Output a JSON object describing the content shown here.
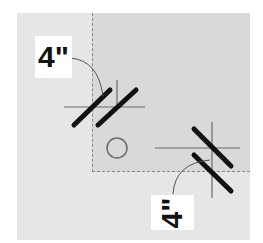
{
  "diagram": {
    "title": "",
    "labels": [
      {
        "id": "top-left-dimension",
        "text": "4\"",
        "orientation": "horizontal"
      },
      {
        "id": "bottom-right-dimension",
        "text": "4\"",
        "orientation": "vertical"
      }
    ],
    "colors": {
      "background": "#ffffff",
      "outer_region": "#e6e6e6",
      "inner_region": "#d9d9d9",
      "line": "#111111",
      "thin_line": "#6a6a6a"
    }
  }
}
